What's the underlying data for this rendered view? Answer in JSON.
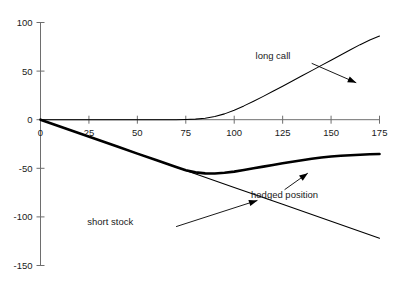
{
  "chart_data": {
    "type": "line",
    "title": "",
    "xlabel": "",
    "ylabel": "",
    "xlim": [
      0,
      175
    ],
    "ylim": [
      -150,
      100
    ],
    "xticks": [
      0,
      25,
      50,
      75,
      100,
      125,
      150,
      175
    ],
    "yticks": [
      100,
      50,
      0,
      -50,
      -100,
      -150
    ],
    "xtick_labels": [
      "0",
      "25",
      "50",
      "75",
      "100",
      "125",
      "150",
      "175"
    ],
    "ytick_labels": [
      "100",
      "50",
      "0",
      "-50",
      "-100",
      "-150"
    ],
    "grid": false,
    "legend": "none",
    "annotations": [
      {
        "id": "long-call",
        "text": "long call",
        "text_x": 120,
        "text_y": 62,
        "arrow_from_x": 140,
        "arrow_from_y": 58,
        "arrow_to_x": 163,
        "arrow_to_y": 38
      },
      {
        "id": "short-stock",
        "text": "short stock",
        "text_x": 36,
        "text_y": -108,
        "arrow_from_x": 70,
        "arrow_from_y": -110,
        "arrow_to_x": 112,
        "arrow_to_y": -83
      },
      {
        "id": "hedged-position",
        "text": "hedged position",
        "text_x": 126,
        "text_y": -81,
        "arrow_from_x": 126,
        "arrow_from_y": -72,
        "arrow_to_x": 138,
        "arrow_to_y": -55
      }
    ],
    "series": [
      {
        "name": "long call",
        "style": "thin",
        "x": [
          0,
          10,
          20,
          30,
          40,
          50,
          60,
          70,
          75,
          80,
          85,
          90,
          95,
          100,
          105,
          110,
          115,
          120,
          125,
          130,
          135,
          140,
          145,
          150,
          155,
          160,
          165,
          170,
          175
        ],
        "values": [
          0,
          0,
          0,
          0,
          0,
          0,
          0,
          0,
          0.2,
          0.6,
          1.5,
          3.2,
          6.0,
          9.8,
          14.2,
          19.0,
          24.0,
          29.2,
          34.5,
          39.8,
          45.2,
          50.5,
          55.9,
          61.2,
          66.6,
          71.9,
          77.2,
          82.0,
          86.0
        ]
      },
      {
        "name": "short stock",
        "style": "thin",
        "x": [
          0,
          25,
          50,
          75,
          100,
          125,
          150,
          175
        ],
        "values": [
          0,
          -17.4,
          -34.9,
          -52.3,
          -69.7,
          -87.1,
          -104.6,
          -122.0
        ]
      },
      {
        "name": "hedged position",
        "style": "thick",
        "x": [
          0,
          10,
          20,
          30,
          40,
          50,
          60,
          70,
          75,
          80,
          85,
          90,
          95,
          100,
          105,
          110,
          115,
          120,
          125,
          130,
          135,
          140,
          145,
          150,
          155,
          160,
          165,
          170,
          175
        ],
        "values": [
          0,
          -7.0,
          -14.0,
          -20.9,
          -27.9,
          -34.9,
          -41.8,
          -48.6,
          -51.9,
          -54.2,
          -55.2,
          -55.3,
          -54.6,
          -53.4,
          -51.8,
          -50.0,
          -48.3,
          -46.6,
          -44.9,
          -43.3,
          -41.7,
          -40.2,
          -38.9,
          -37.9,
          -37.1,
          -36.5,
          -36.0,
          -35.6,
          -35.3
        ]
      }
    ]
  }
}
